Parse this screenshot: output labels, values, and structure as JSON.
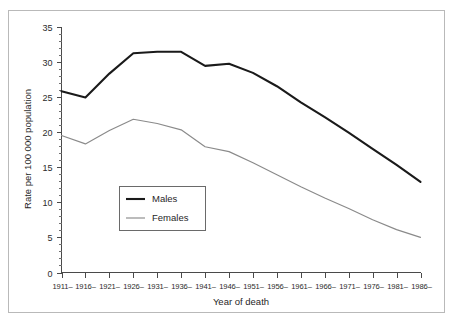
{
  "chart_data": {
    "type": "line",
    "title": "",
    "subtitle": "",
    "xlabel": "Year of death",
    "ylabel": "Rate per 100 000 population",
    "categories": [
      "1911–",
      "1916–",
      "1921–",
      "1926–",
      "1931–",
      "1936–",
      "1941–",
      "1946–",
      "1951–",
      "1956–",
      "1961–",
      "1966–",
      "1971–",
      "1976–",
      "1981–",
      "1986–"
    ],
    "series": [
      {
        "name": "Males",
        "color": "#1a1a1a",
        "line_width": 2.1,
        "values": [
          25.8,
          24.9,
          28.3,
          31.2,
          31.4,
          31.4,
          29.4,
          29.7,
          28.4,
          26.5,
          24.2,
          22.1,
          19.9,
          17.6,
          15.3,
          12.9
        ]
      },
      {
        "name": "Females",
        "color": "#8a8a8a",
        "line_width": 1.15,
        "values": [
          19.5,
          18.3,
          20.2,
          21.8,
          21.2,
          20.3,
          17.9,
          17.2,
          15.6,
          13.9,
          12.2,
          10.6,
          9.1,
          7.5,
          6.1,
          5.0
        ]
      }
    ],
    "ylim": [
      0,
      35
    ],
    "yticks": [
      0,
      5,
      10,
      15,
      20,
      25,
      30,
      35
    ],
    "ytick_labels": [
      "0",
      "5",
      "10",
      "15",
      "20",
      "25",
      "30",
      "35"
    ],
    "y_minor_step": 1,
    "grid": false,
    "legend_position": "inside-lower-left",
    "legend_entries": [
      "Males",
      "Females"
    ]
  }
}
